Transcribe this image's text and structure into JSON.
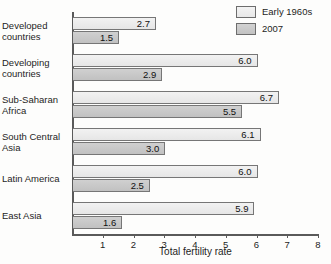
{
  "chart_data": {
    "type": "bar",
    "orientation": "horizontal",
    "title": "",
    "xlabel": "Total fertility rate",
    "ylabel": "",
    "xlim": [
      0,
      8
    ],
    "xticks": [
      "1",
      "2",
      "3",
      "4",
      "5",
      "6",
      "7",
      "8"
    ],
    "grid": false,
    "legend_position": "top-right",
    "categories": [
      "Developed countries",
      "Developing countries",
      "Sub-Saharan Africa",
      "South Central Asia",
      "Latin America",
      "East Asia"
    ],
    "series": [
      {
        "name": "Early 1960s",
        "color": "#ebebeb",
        "values": [
          2.7,
          6.0,
          6.7,
          6.1,
          6.0,
          5.9
        ],
        "labels": [
          "2.7",
          "6.0",
          "6.7",
          "6.1",
          "6.0",
          "5.9"
        ]
      },
      {
        "name": "2007",
        "color": "#c8c8c8",
        "values": [
          1.5,
          2.9,
          5.5,
          3.0,
          2.5,
          1.6
        ],
        "labels": [
          "1.5",
          "2.9",
          "5.5",
          "3.0",
          "2.5",
          "1.6"
        ]
      }
    ]
  },
  "legend": {
    "items": [
      {
        "label": "Early 1960s"
      },
      {
        "label": "2007"
      }
    ]
  },
  "category_lines": [
    [
      "Developed",
      "countries"
    ],
    [
      "Developing",
      "countries"
    ],
    [
      "Sub-Saharan",
      "Africa"
    ],
    [
      "South Central",
      "Asia"
    ],
    [
      "Latin America",
      ""
    ],
    [
      "East Asia",
      ""
    ]
  ]
}
